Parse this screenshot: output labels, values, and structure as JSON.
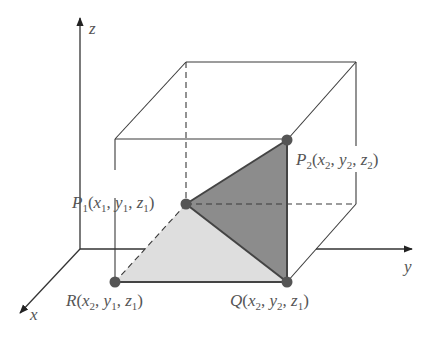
{
  "figure": {
    "colors": {
      "line": "#3a3a3a",
      "axis": "#333333",
      "point": "#555555",
      "dark_face": "#8c8c8c",
      "light_face": "#dedede",
      "label": "#555555"
    },
    "axes": {
      "x": {
        "label": "x"
      },
      "y": {
        "label": "y"
      },
      "z": {
        "label": "z"
      }
    },
    "points": {
      "P1": {
        "name": "P",
        "sub": "1",
        "coords": [
          "x",
          "1",
          "y",
          "1",
          "z",
          "1"
        ]
      },
      "P2": {
        "name": "P",
        "sub": "2",
        "coords": [
          "x",
          "2",
          "y",
          "2",
          "z",
          "2"
        ]
      },
      "Q": {
        "name": "Q",
        "sub": "",
        "coords": [
          "x",
          "2",
          "y",
          "2",
          "z",
          "1"
        ]
      },
      "R": {
        "name": "R",
        "sub": "",
        "coords": [
          "x",
          "2",
          "y",
          "1",
          "z",
          "1"
        ]
      }
    }
  }
}
